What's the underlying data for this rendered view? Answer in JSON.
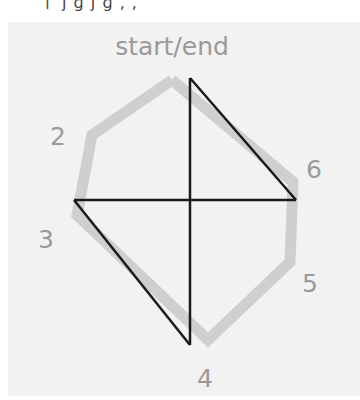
{
  "top_strip": {
    "text": "ㅣ ȷ ɡ ȷ ɡ , ,"
  },
  "diagram": {
    "title_label": "start/end",
    "vertex_labels": {
      "v2": "2",
      "v3": "3",
      "v4": "4",
      "v5": "5",
      "v6": "6"
    },
    "colors": {
      "panel_bg": "#f2f2f2",
      "route": "#cfcfcf",
      "shortcut": "#1a1a1a",
      "label": "#9a9a9a"
    },
    "route_points": "172,80 92,135 77,215 208,340 290,262 293,182 172,80",
    "shortcut_lines": [
      {
        "x1": 190,
        "y1": 78,
        "x2": 190,
        "y2": 345
      },
      {
        "x1": 74,
        "y1": 200,
        "x2": 296,
        "y2": 200
      },
      {
        "x1": 190,
        "y1": 78,
        "x2": 296,
        "y2": 200
      },
      {
        "x1": 74,
        "y1": 200,
        "x2": 190,
        "y2": 345
      }
    ]
  }
}
